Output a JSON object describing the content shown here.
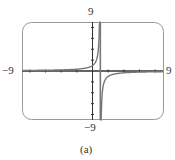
{
  "chart_data": {
    "type": "line",
    "title": "",
    "caption": "(a)",
    "xlabel": "",
    "ylabel": "",
    "xlim": [
      -9,
      9
    ],
    "ylim": [
      -9,
      9
    ],
    "x_tick_step": 2,
    "y_tick_step": 2,
    "grid": false,
    "frame": "rounded-rectangle",
    "axis_labels": {
      "xmin": "−9",
      "xmax": "9",
      "ymin": "−9",
      "ymax": "9"
    },
    "vertical_asymptote_x": 1,
    "horizontal_asymptote_y": 0,
    "series": [
      {
        "name": "y = 1/(1 - x)",
        "function": "1/(1-x)",
        "color": "#777777"
      }
    ]
  },
  "colors": {
    "frame": "#999999",
    "axes": "#333333",
    "curve": "#777777"
  }
}
